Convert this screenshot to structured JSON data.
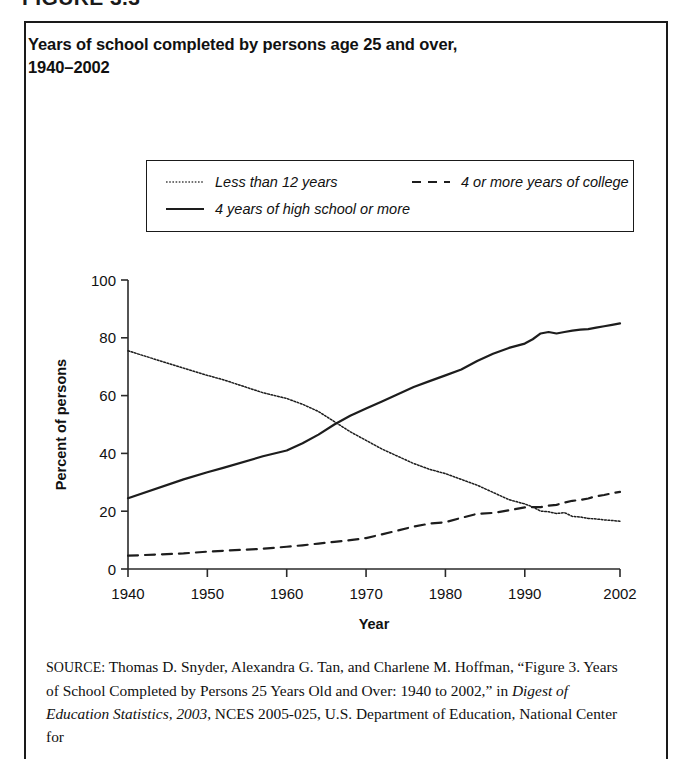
{
  "figure": {
    "caption": "FIGURE 3.3",
    "title_line1": "Years of school completed by persons age 25 and over,",
    "title_line2": "1940–2002"
  },
  "legend": {
    "items": [
      {
        "label": "Less than 12 years",
        "style": "dotted",
        "icon": "dotted-line-icon"
      },
      {
        "label": "4 or more years of college",
        "style": "dashed",
        "icon": "dashed-line-icon"
      },
      {
        "label": "4 years of high school or more",
        "style": "solid",
        "icon": "solid-line-icon"
      }
    ]
  },
  "source": {
    "label": "SOURCE:",
    "text_part1": " Thomas D. Snyder, Alexandra G. Tan, and Charlene M. Hoffman, “Figure 3. Years of School Completed by Persons 25 Years Old and Over: 1940 to 2002,” in ",
    "italic_part": "Digest of Education Statistics, 2003",
    "text_part2": ", NCES 2005-025, U.S. Department of Education, National Center for"
  },
  "chart_data": {
    "type": "line",
    "title": "Years of school completed by persons age 25 and over, 1940–2002",
    "xlabel": "Year",
    "ylabel": "Percent of persons",
    "xlim": [
      1940,
      2002
    ],
    "ylim": [
      0,
      100
    ],
    "xticks": [
      1940,
      1950,
      1960,
      1970,
      1980,
      1990,
      2002
    ],
    "yticks": [
      0,
      20,
      40,
      60,
      80,
      100
    ],
    "grid": false,
    "legend_position": "above-plot",
    "series": [
      {
        "name": "Less than 12 years",
        "style": "dotted",
        "x": [
          1940,
          1947,
          1950,
          1952,
          1957,
          1960,
          1962,
          1964,
          1966,
          1968,
          1970,
          1972,
          1974,
          1976,
          1978,
          1980,
          1982,
          1984,
          1986,
          1988,
          1990,
          1991,
          1992,
          1993,
          1994,
          1995,
          1996,
          1997,
          1998,
          1999,
          2000,
          2001,
          2002
        ],
        "values": [
          75.5,
          69.5,
          67.0,
          65.5,
          61.0,
          59.0,
          57.0,
          54.5,
          51.0,
          47.5,
          44.5,
          41.5,
          39.0,
          36.5,
          34.5,
          33.0,
          31.0,
          29.0,
          26.5,
          24.0,
          22.5,
          21.5,
          20.0,
          19.8,
          19.2,
          19.5,
          18.2,
          18.0,
          17.5,
          17.3,
          17.0,
          16.8,
          16.5
        ]
      },
      {
        "name": "4 years of high school or more",
        "style": "solid",
        "x": [
          1940,
          1947,
          1950,
          1952,
          1957,
          1960,
          1962,
          1964,
          1966,
          1968,
          1970,
          1972,
          1974,
          1976,
          1978,
          1980,
          1982,
          1984,
          1986,
          1988,
          1990,
          1991,
          1992,
          1993,
          1994,
          1995,
          1996,
          1997,
          1998,
          1999,
          2000,
          2001,
          2002
        ],
        "values": [
          24.5,
          31.0,
          33.5,
          35.0,
          39.0,
          41.0,
          43.5,
          46.5,
          50.0,
          53.0,
          55.5,
          58.0,
          60.5,
          63.0,
          65.0,
          67.0,
          69.0,
          72.0,
          74.5,
          76.5,
          78.0,
          79.5,
          81.5,
          82.0,
          81.5,
          82.0,
          82.5,
          82.8,
          83.0,
          83.5,
          84.0,
          84.5,
          85.0
        ]
      },
      {
        "name": "4 or more years of college",
        "style": "dashed",
        "x": [
          1940,
          1947,
          1950,
          1952,
          1957,
          1960,
          1962,
          1964,
          1966,
          1968,
          1970,
          1972,
          1974,
          1976,
          1978,
          1980,
          1982,
          1984,
          1986,
          1988,
          1990,
          1991,
          1992,
          1993,
          1994,
          1995,
          1996,
          1997,
          1998,
          1999,
          2000,
          2001,
          2002
        ],
        "values": [
          4.6,
          5.4,
          6.0,
          6.3,
          7.0,
          7.7,
          8.2,
          8.8,
          9.4,
          10.0,
          10.7,
          12.0,
          13.3,
          14.7,
          15.7,
          16.2,
          17.7,
          19.1,
          19.4,
          20.3,
          21.3,
          21.4,
          21.4,
          21.9,
          22.2,
          23.0,
          23.6,
          23.9,
          24.4,
          25.2,
          25.6,
          26.2,
          26.7
        ]
      }
    ]
  },
  "plot_geometry": {
    "x0": 128,
    "x1": 620,
    "y0": 569,
    "y1": 280
  }
}
